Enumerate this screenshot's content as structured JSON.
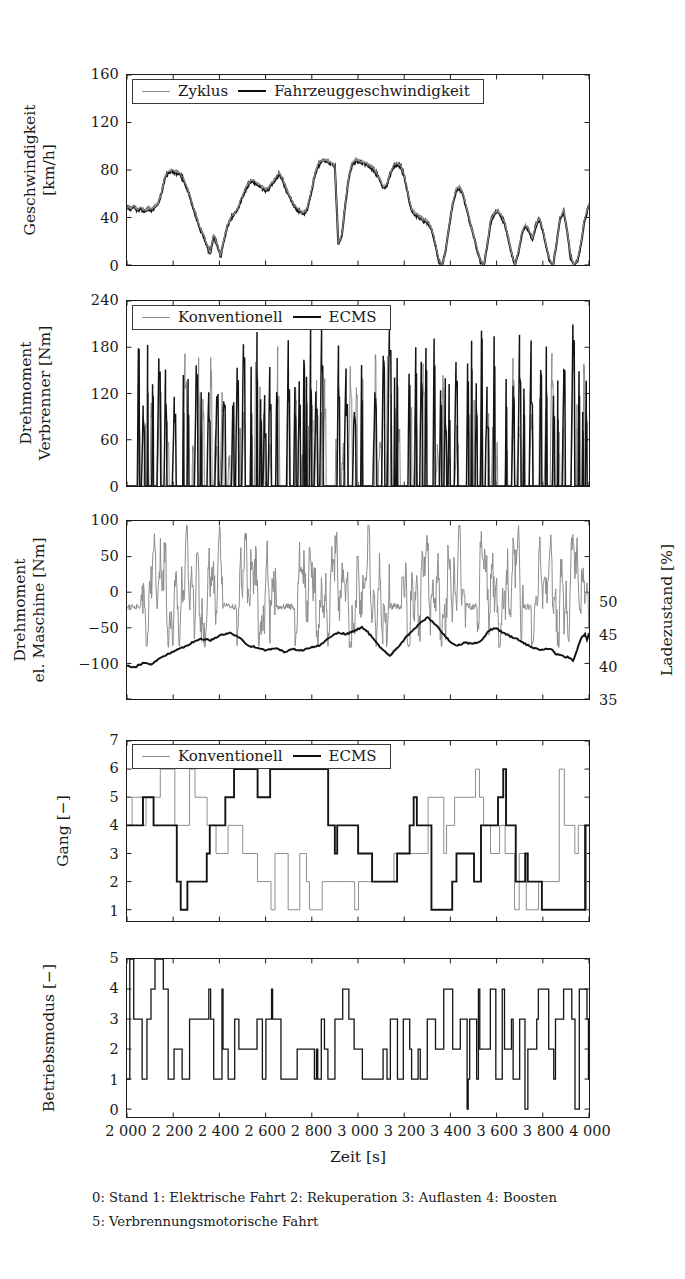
{
  "figure": {
    "xlabel": "Zeit [s]",
    "xticks": [
      "2 000",
      "2 200",
      "2 400",
      "2 600",
      "2 800",
      "3 000",
      "3 200",
      "3 400",
      "3 600",
      "3 800",
      "4 000"
    ],
    "caption_line1": "0: Stand 1: Elektrische Fahrt 2: Rekuperation 3: Auflasten 4: Boosten",
    "caption_line2": "5: Verbrennungsmotorische Fahrt",
    "colors": {
      "reference": "#8c8c8c",
      "primary": "#141414",
      "axis": "#1a1a1a"
    }
  },
  "panels": {
    "speed": {
      "ylabel_line1": "Geschwindigkeit",
      "ylabel_line2": "[km/h]",
      "yticks": [
        "160",
        "120",
        "80",
        "40",
        "0"
      ],
      "legend": {
        "series1": "Zyklus",
        "series2": "Fahrzeuggeschwindigkeit"
      }
    },
    "engine_torque": {
      "ylabel_line1": "Drehmoment",
      "ylabel_line2": "Verbrenner [Nm]",
      "yticks": [
        "240",
        "180",
        "120",
        "60",
        "0"
      ],
      "legend": {
        "series1": "Konventionell",
        "series2": "ECMS"
      }
    },
    "motor_torque": {
      "ylabel_line1": "Drehmoment",
      "ylabel_line2": "el. Maschine [Nm]",
      "yticks": [
        "100",
        "50",
        "0",
        "−50",
        "−100"
      ],
      "ylabel_right": "Ladezustand [%]",
      "yticks_right": [
        "50",
        "45",
        "40",
        "35"
      ]
    },
    "gear": {
      "ylabel": "Gang [−]",
      "yticks": [
        "7",
        "6",
        "5",
        "4",
        "3",
        "2",
        "1"
      ],
      "legend": {
        "series1": "Konventionell",
        "series2": "ECMS"
      }
    },
    "mode": {
      "ylabel": "Betriebsmodus [−]",
      "yticks": [
        "5",
        "4",
        "3",
        "2",
        "1",
        "0"
      ]
    }
  },
  "chart_data": [
    {
      "id": "speed",
      "type": "line",
      "title": "",
      "xlabel": "Zeit [s]",
      "ylabel": "Geschwindigkeit [km/h]",
      "xlim": [
        2000,
        4000
      ],
      "ylim": [
        0,
        160
      ],
      "yticks": [
        0,
        40,
        80,
        120,
        160
      ],
      "xticks": [
        2000,
        2200,
        2400,
        2600,
        2800,
        3000,
        3200,
        3400,
        3600,
        3800,
        4000
      ],
      "grid": false,
      "legend_position": "top-left",
      "series": [
        {
          "name": "Zyklus",
          "color": "#8c8c8c",
          "width": 1.1,
          "x": [
            2000,
            2015,
            2030,
            2045,
            2060,
            2075,
            2090,
            2105,
            2120,
            2135,
            2150,
            2165,
            2180,
            2195,
            2210,
            2225,
            2240,
            2255,
            2270,
            2285,
            2300,
            2315,
            2330,
            2345,
            2360,
            2375,
            2390,
            2405,
            2420,
            2435,
            2450,
            2465,
            2480,
            2495,
            2510,
            2525,
            2540,
            2555,
            2570,
            2585,
            2600,
            2615,
            2630,
            2645,
            2660,
            2675,
            2690,
            2705,
            2720,
            2735,
            2750,
            2765,
            2780,
            2795,
            2810,
            2825,
            2840,
            2855,
            2870,
            2885,
            2900,
            2915,
            2930,
            2945,
            2960,
            2975,
            2990,
            3005,
            3020,
            3035,
            3050,
            3065,
            3080,
            3095,
            3110,
            3125,
            3140,
            3155,
            3170,
            3185,
            3200,
            3215,
            3230,
            3245,
            3260,
            3275,
            3290,
            3305,
            3320,
            3335,
            3350,
            3365,
            3380,
            3395,
            3410,
            3425,
            3440,
            3455,
            3470,
            3485,
            3500,
            3515,
            3530,
            3545,
            3560,
            3575,
            3590,
            3605,
            3620,
            3635,
            3650,
            3665,
            3680,
            3695,
            3710,
            3725,
            3740,
            3755,
            3770,
            3785,
            3800,
            3815,
            3830,
            3845,
            3860,
            3875,
            3890,
            3905,
            3920,
            3935,
            3950,
            3965,
            3980,
            4000
          ],
          "y": [
            49,
            48,
            50,
            47,
            49,
            46,
            48,
            47,
            50,
            52,
            62,
            75,
            79,
            80,
            79,
            78,
            74,
            68,
            60,
            50,
            41,
            32,
            26,
            18,
            10,
            26,
            18,
            8,
            22,
            34,
            40,
            44,
            48,
            56,
            63,
            69,
            72,
            70,
            68,
            66,
            64,
            66,
            70,
            74,
            78,
            72,
            64,
            58,
            52,
            48,
            46,
            44,
            48,
            60,
            74,
            84,
            88,
            89,
            88,
            86,
            84,
            18,
            26,
            52,
            74,
            86,
            89,
            88,
            87,
            86,
            84,
            82,
            78,
            72,
            66,
            68,
            78,
            84,
            86,
            84,
            76,
            62,
            48,
            44,
            42,
            40,
            38,
            36,
            30,
            18,
            4,
            0,
            14,
            34,
            52,
            64,
            66,
            60,
            48,
            36,
            26,
            14,
            4,
            0,
            18,
            38,
            44,
            46,
            42,
            36,
            24,
            10,
            0,
            12,
            28,
            34,
            30,
            22,
            34,
            40,
            30,
            16,
            4,
            0,
            20,
            40,
            46,
            30,
            8,
            0,
            4,
            18,
            38,
            52,
            62,
            70,
            74,
            72,
            76,
            78,
            74,
            72,
            30
          ]
        },
        {
          "name": "Fahrzeuggeschwindigkeit",
          "color": "#141414",
          "width": 2.1,
          "x": [
            2000,
            2015,
            2030,
            2045,
            2060,
            2075,
            2090,
            2105,
            2120,
            2135,
            2150,
            2165,
            2180,
            2195,
            2210,
            2225,
            2240,
            2255,
            2270,
            2285,
            2300,
            2315,
            2330,
            2345,
            2360,
            2375,
            2390,
            2405,
            2420,
            2435,
            2450,
            2465,
            2480,
            2495,
            2510,
            2525,
            2540,
            2555,
            2570,
            2585,
            2600,
            2615,
            2630,
            2645,
            2660,
            2675,
            2690,
            2705,
            2720,
            2735,
            2750,
            2765,
            2780,
            2795,
            2810,
            2825,
            2840,
            2855,
            2870,
            2885,
            2900,
            2915,
            2930,
            2945,
            2960,
            2975,
            2990,
            3005,
            3020,
            3035,
            3050,
            3065,
            3080,
            3095,
            3110,
            3125,
            3140,
            3155,
            3170,
            3185,
            3200,
            3215,
            3230,
            3245,
            3260,
            3275,
            3290,
            3305,
            3320,
            3335,
            3350,
            3365,
            3380,
            3395,
            3410,
            3425,
            3440,
            3455,
            3470,
            3485,
            3500,
            3515,
            3530,
            3545,
            3560,
            3575,
            3590,
            3605,
            3620,
            3635,
            3650,
            3665,
            3680,
            3695,
            3710,
            3725,
            3740,
            3755,
            3770,
            3785,
            3800,
            3815,
            3830,
            3845,
            3860,
            3875,
            3890,
            3905,
            3920,
            3935,
            3950,
            3965,
            3980,
            4000
          ],
          "y": [
            48,
            47,
            49,
            46,
            48,
            45,
            47,
            46,
            49,
            51,
            61,
            74,
            78,
            79,
            78,
            77,
            73,
            67,
            59,
            49,
            40,
            31,
            25,
            17,
            9,
            25,
            17,
            7,
            21,
            33,
            39,
            43,
            47,
            55,
            62,
            68,
            71,
            69,
            67,
            65,
            63,
            65,
            69,
            73,
            77,
            71,
            63,
            57,
            51,
            47,
            45,
            43,
            47,
            59,
            73,
            83,
            87,
            88,
            87,
            85,
            83,
            17,
            25,
            51,
            73,
            85,
            88,
            87,
            86,
            85,
            83,
            81,
            77,
            71,
            65,
            67,
            77,
            83,
            85,
            83,
            75,
            61,
            47,
            43,
            41,
            39,
            37,
            35,
            29,
            17,
            3,
            0,
            13,
            33,
            51,
            63,
            65,
            59,
            47,
            35,
            25,
            13,
            3,
            0,
            17,
            37,
            43,
            45,
            41,
            35,
            23,
            9,
            0,
            11,
            27,
            33,
            29,
            21,
            33,
            39,
            29,
            15,
            3,
            0,
            19,
            39,
            45,
            29,
            7,
            0,
            3,
            17,
            37,
            51,
            61,
            69,
            73,
            71,
            75,
            77,
            73,
            71,
            29
          ]
        }
      ]
    },
    {
      "id": "engine_torque",
      "type": "line",
      "xlabel": "Zeit [s]",
      "ylabel": "Drehmoment Verbrenner [Nm]",
      "xlim": [
        2000,
        4000
      ],
      "ylim": [
        0,
        240
      ],
      "yticks": [
        0,
        60,
        120,
        180,
        240
      ],
      "grid": false,
      "legend_position": "top-left",
      "description": "Dense spiky combustion-engine torque traces; conventional reference in grey peaks mostly 60-120 Nm, ECMS in black spikes to 180-200 Nm",
      "series": [
        {
          "name": "Konventionell",
          "color": "#8c8c8c",
          "width": 1.0,
          "peak_range": [
            0,
            190
          ],
          "typical_peak": 95
        },
        {
          "name": "ECMS",
          "color": "#141414",
          "width": 1.6,
          "peak_range": [
            0,
            205
          ],
          "typical_peak": 170
        }
      ]
    },
    {
      "id": "motor_torque",
      "type": "line",
      "xlabel": "Zeit [s]",
      "ylabel": "Drehmoment el. Maschine [Nm]",
      "ylabel_secondary": "Ladezustand [%]",
      "xlim": [
        2000,
        4000
      ],
      "ylim": [
        -150,
        100
      ],
      "yticks": [
        -100,
        -50,
        0,
        50,
        100
      ],
      "ylim_secondary": [
        35,
        62.5
      ],
      "yticks_secondary": [
        35,
        40,
        45,
        50
      ],
      "grid": false,
      "description": "Grey oscillating electric-machine torque between -70 and +95 Nm; black state-of-charge line drifting from 40% up to ~48% and back to ~45%",
      "series": [
        {
          "name": "Drehmoment el. Maschine",
          "color": "#8c8c8c",
          "width": 1.0,
          "axis": "left",
          "range": [
            -75,
            95
          ]
        },
        {
          "name": "Ladezustand",
          "color": "#141414",
          "width": 2.0,
          "axis": "right",
          "start": 40.2,
          "end": 45.3,
          "min": 39.8,
          "max": 48.0
        }
      ]
    },
    {
      "id": "gear",
      "type": "line",
      "xlabel": "Zeit [s]",
      "ylabel": "Gang [−]",
      "xlim": [
        2000,
        4000
      ],
      "ylim": [
        0.6,
        7
      ],
      "yticks": [
        1,
        2,
        3,
        4,
        5,
        6,
        7
      ],
      "grid": false,
      "legend_position": "top-left",
      "description": "Step-shaped gear selection traces, values 1 to 6",
      "series": [
        {
          "name": "Konventionell",
          "color": "#8c8c8c",
          "width": 1.0,
          "values_range": [
            1,
            6
          ]
        },
        {
          "name": "ECMS",
          "color": "#141414",
          "width": 1.9,
          "values_range": [
            1,
            6
          ]
        }
      ]
    },
    {
      "id": "mode",
      "type": "line",
      "xlabel": "Zeit [s]",
      "ylabel": "Betriebsmodus [−]",
      "xlim": [
        2000,
        4000
      ],
      "ylim": [
        -0.35,
        5.4
      ],
      "yticks": [
        0,
        1,
        2,
        3,
        4,
        5
      ],
      "grid": false,
      "description": "Discrete operating-mode step trace taking values 0-5",
      "series": [
        {
          "name": "Betriebsmodus",
          "color": "#141414",
          "width": 1.3,
          "values_range": [
            0,
            5
          ],
          "legend_map": {
            "0": "Stand",
            "1": "Elektrische Fahrt",
            "2": "Rekuperation",
            "3": "Auflasten",
            "4": "Boosten",
            "5": "Verbrennungsmotorische Fahrt"
          }
        }
      ]
    }
  ]
}
